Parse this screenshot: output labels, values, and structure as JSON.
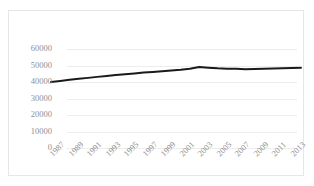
{
  "chart_data": {
    "type": "line",
    "title": "",
    "subtitle": "",
    "xlabel": "",
    "ylabel": "",
    "ylim": [
      0,
      60000
    ],
    "ytick_labels": [
      "60000",
      "50000",
      "40000",
      "30000",
      "20000",
      "10000",
      "0"
    ],
    "ytick_values": [
      60000,
      50000,
      40000,
      30000,
      20000,
      10000,
      0
    ],
    "grid": true,
    "legend": false,
    "legend_position": "none",
    "xtick_labels": [
      "1987",
      "1989",
      "1991",
      "1993",
      "1995",
      "1997",
      "1999",
      "2001",
      "2003",
      "2005",
      "2007",
      "2009",
      "2011",
      "2013"
    ],
    "x": [
      1987,
      1988,
      1989,
      1990,
      1991,
      1992,
      1993,
      1994,
      1995,
      1996,
      1997,
      1998,
      1999,
      2000,
      2001,
      2002,
      2003,
      2004,
      2005,
      2006,
      2007,
      2008,
      2009,
      2010,
      2011,
      2012,
      2013,
      2014
    ],
    "series": [
      {
        "name": "series-1",
        "color": "#1a1a1a",
        "values": [
          40000,
          40600,
          41300,
          41900,
          42500,
          43100,
          43700,
          44200,
          44700,
          45200,
          45700,
          46100,
          46500,
          47000,
          47400,
          48000,
          49100,
          48700,
          48300,
          48100,
          48000,
          47800,
          47900,
          48000,
          48200,
          48300,
          48500,
          48700
        ]
      }
    ]
  },
  "style": {
    "line_color": "#1a1a1a",
    "grid_color": "#ededed",
    "tick_text_color": "#8f8f8f",
    "border_color": "#e6e6e6",
    "background": "#ffffff"
  }
}
